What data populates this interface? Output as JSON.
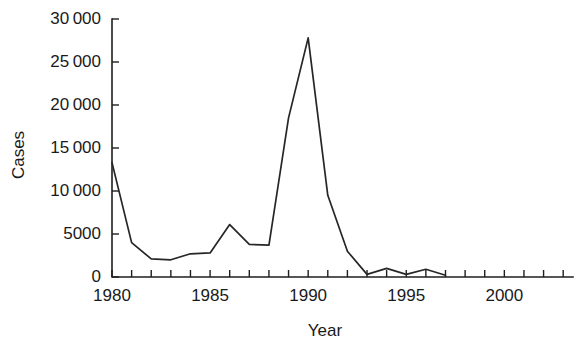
{
  "chart_data": {
    "type": "line",
    "title": "",
    "xlabel": "Year",
    "ylabel": "Cases",
    "xlim": [
      1980,
      2003.5
    ],
    "ylim": [
      0,
      30000
    ],
    "grid": false,
    "legend": null,
    "x_ticks_major": [
      1980,
      1985,
      1990,
      1995,
      2000
    ],
    "x_tick_labels": [
      "1980",
      "1985",
      "1990",
      "1995",
      "2000"
    ],
    "x_minor_tick_step": 1,
    "y_ticks": [
      0,
      5000,
      10000,
      15000,
      20000,
      25000,
      30000
    ],
    "y_tick_labels": [
      "0",
      "5000",
      "10 000",
      "15 000",
      "20 000",
      "25 000",
      "30 000"
    ],
    "series": [
      {
        "name": "Cases",
        "color": "#262626",
        "x": [
          1980,
          1981,
          1982,
          1983,
          1984,
          1985,
          1986,
          1987,
          1988,
          1989,
          1990,
          1991,
          1992,
          1993,
          1994,
          1995,
          1996,
          1997
        ],
        "values": [
          13300,
          4000,
          2100,
          2000,
          2700,
          2800,
          6100,
          3800,
          3700,
          18500,
          27800,
          9500,
          3000,
          300,
          1000,
          300,
          900,
          200
        ]
      }
    ]
  },
  "axes": {
    "y_title": "Cases",
    "x_title": "Year"
  }
}
